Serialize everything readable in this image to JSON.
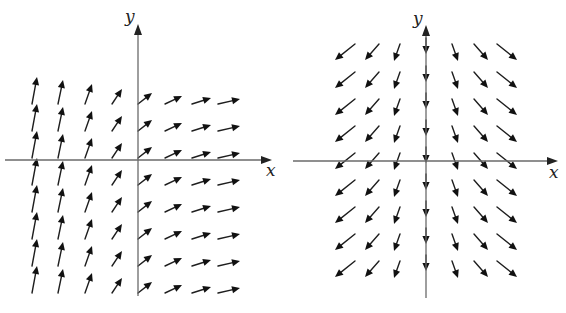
{
  "figures": [
    {
      "id": "left",
      "description": "Vector field: arrows point up steeply on the left, flattening to point right on the right",
      "axes": {
        "x_label": "x",
        "y_label": "y",
        "origin": [
          138,
          160
        ],
        "x_axis": {
          "from": 5,
          "to": 272
        },
        "y_axis": {
          "from": 296,
          "to": 24
        },
        "x_label_pos": [
          266,
          176
        ],
        "y_label_pos": [
          125,
          22
        ]
      },
      "grid": {
        "columns": [
          32,
          58,
          85,
          112,
          138,
          165,
          192,
          218
        ],
        "rows": [
          77,
          104,
          131,
          158,
          185,
          212,
          239,
          266
        ]
      },
      "column_vectors": [
        {
          "dx": 5,
          "dy": -27
        },
        {
          "dx": 5,
          "dy": -24
        },
        {
          "dx": 7,
          "dy": -20
        },
        {
          "dx": 10,
          "dy": -15
        },
        {
          "dx": 14,
          "dy": -11
        },
        {
          "dx": 17,
          "dy": -8
        },
        {
          "dx": 19,
          "dy": -6
        },
        {
          "dx": 22,
          "dy": -5
        }
      ]
    },
    {
      "id": "right",
      "description": "Vector field: arrows point downward everywhere, with horizontal component pointing away from the y-axis",
      "axes": {
        "x_label": "x",
        "y_label": "y",
        "origin": [
          426,
          161
        ],
        "x_axis": {
          "from": 293,
          "to": 558
        },
        "y_axis": {
          "from": 298,
          "to": 25
        },
        "x_label_pos": [
          549,
          178
        ],
        "y_label_pos": [
          413,
          24
        ]
      },
      "grid": {
        "columns": [
          345,
          372,
          397,
          426,
          455,
          481,
          507
        ],
        "rows": [
          52,
          80,
          107,
          134,
          161,
          188,
          215,
          242,
          269
        ]
      },
      "column_vectors": [
        {
          "dx": -20,
          "dy": -16
        },
        {
          "dx": -14,
          "dy": -16
        },
        {
          "dx": -6,
          "dy": -17
        },
        {
          "dx": 0,
          "dy": -17
        },
        {
          "dx": 6,
          "dy": -17
        },
        {
          "dx": 14,
          "dy": -16
        },
        {
          "dx": 20,
          "dy": -16
        }
      ]
    }
  ]
}
